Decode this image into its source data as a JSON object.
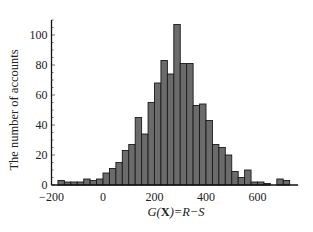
{
  "chart_data": {
    "type": "bar",
    "subtype": "histogram",
    "title": "",
    "xlabel": "G(X)=R−S",
    "ylabel": "The number of accounts",
    "bin_width": 25,
    "bin_start": -175,
    "categories": [
      -175,
      -150,
      -125,
      -100,
      -75,
      -50,
      -25,
      0,
      25,
      50,
      75,
      100,
      125,
      150,
      175,
      200,
      225,
      250,
      275,
      300,
      325,
      350,
      375,
      400,
      425,
      450,
      475,
      500,
      525,
      550,
      575,
      600,
      625,
      650,
      675,
      700,
      725
    ],
    "values": [
      3,
      2,
      2,
      2,
      4,
      3,
      4,
      8,
      11,
      15,
      23,
      27,
      45,
      34,
      55,
      68,
      83,
      74,
      107,
      81,
      81,
      53,
      54,
      43,
      27,
      25,
      20,
      9,
      5,
      10,
      2,
      2,
      1,
      0,
      4,
      3,
      0
    ],
    "xlim": [
      -200,
      750
    ],
    "ylim": [
      0,
      110
    ],
    "x_ticks": [
      -200,
      0,
      200,
      400,
      600
    ],
    "y_ticks": [
      0,
      20,
      40,
      60,
      80,
      100
    ],
    "grid": false,
    "legend": null,
    "bar_color": "#6b6b6b",
    "edge_color": "#1a1a1a"
  },
  "axes": {
    "x_tick_labels": [
      "−200",
      "0",
      "200",
      "400",
      "600"
    ],
    "y_tick_labels": [
      "0",
      "20",
      "40",
      "60",
      "80",
      "100"
    ],
    "xlabel_parts": {
      "g": "G(",
      "x": "X",
      "rest": ")=R−S"
    },
    "ylabel": "The number of accounts"
  }
}
